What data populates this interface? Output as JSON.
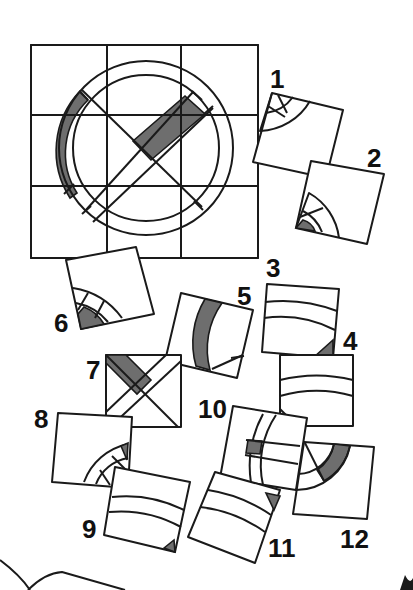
{
  "puzzle": {
    "description": "3x3 grid target picture: a circle with a diagonal cross, shaded ring segment on the left and shaded bar on upper-right diagonal; 12 scattered rotated tile pieces to match",
    "grid": {
      "rows": 3,
      "cols": 3
    },
    "colors": {
      "ink": "#1a1a1a",
      "shade": "#6e6e6e",
      "background": "#ffffff"
    },
    "pieces": [
      {
        "label": "1"
      },
      {
        "label": "2"
      },
      {
        "label": "3"
      },
      {
        "label": "4"
      },
      {
        "label": "5"
      },
      {
        "label": "6"
      },
      {
        "label": "7"
      },
      {
        "label": "8"
      },
      {
        "label": "9"
      },
      {
        "label": "10"
      },
      {
        "label": "11"
      },
      {
        "label": "12"
      }
    ]
  }
}
